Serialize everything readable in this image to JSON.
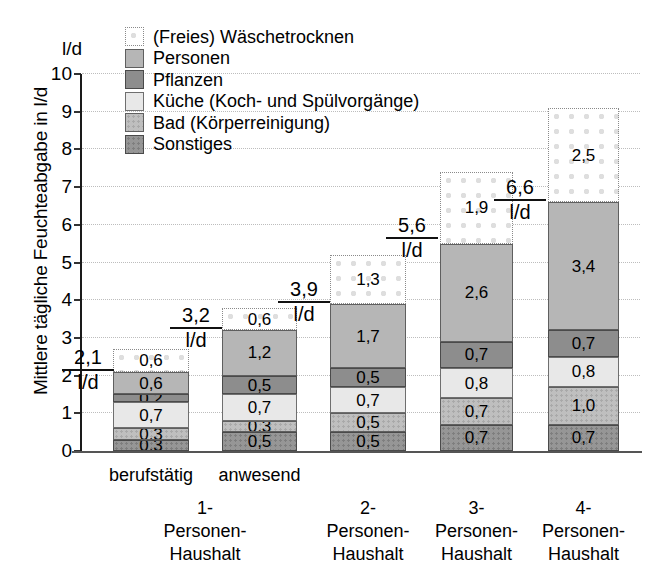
{
  "chart_data": {
    "type": "bar",
    "stacked": true,
    "title": "",
    "xlabel": "",
    "ylabel": "Mittlere tägliche Feuchteabgabe in l/d",
    "yunit": "l/d",
    "ylim": [
      0,
      10
    ],
    "yticks": [
      "0",
      "1",
      "2",
      "3",
      "4",
      "5",
      "6",
      "7",
      "8",
      "9",
      "10"
    ],
    "grid": true,
    "legend_position": "top-center",
    "categories": [
      {
        "sub": "berufstätig",
        "main": [
          "1-",
          "Personen-",
          "Haushalt"
        ]
      },
      {
        "sub": "anwesend",
        "main": [
          "",
          "",
          ""
        ]
      },
      {
        "sub": "",
        "main": [
          "2-",
          "Personen-",
          "Haushalt"
        ]
      },
      {
        "sub": "",
        "main": [
          "3-",
          "Personen-",
          "Haushalt"
        ]
      },
      {
        "sub": "",
        "main": [
          "4-",
          "Personen-",
          "Haushalt"
        ]
      }
    ],
    "series": [
      {
        "name": "Sonstiges",
        "key": "sonstiges",
        "values": [
          0.3,
          0.5,
          0.5,
          0.7,
          0.7
        ],
        "labels": [
          "0,3",
          "0,5",
          "0,5",
          "0,7",
          "0,7"
        ]
      },
      {
        "name": "Bad (Körperreinigung)",
        "key": "bad",
        "values": [
          0.3,
          0.3,
          0.5,
          0.7,
          1.0
        ],
        "labels": [
          "0,3",
          "0,3",
          "0,5",
          "0,7",
          "1,0"
        ]
      },
      {
        "name": "Küche (Koch- und Spülvorgänge)",
        "key": "kueche",
        "values": [
          0.7,
          0.7,
          0.7,
          0.8,
          0.8
        ],
        "labels": [
          "0,7",
          "0,7",
          "0,7",
          "0,8",
          "0,8"
        ]
      },
      {
        "name": "Pflanzen",
        "key": "pflanzen",
        "values": [
          0.2,
          0.5,
          0.5,
          0.7,
          0.7
        ],
        "labels": [
          "0,2",
          "0,5",
          "0,5",
          "0,7",
          "0,7"
        ]
      },
      {
        "name": "Personen",
        "key": "personen",
        "values": [
          0.6,
          1.2,
          1.7,
          2.6,
          3.4
        ],
        "labels": [
          "0,6",
          "1,2",
          "1,7",
          "2,6",
          "3,4"
        ]
      },
      {
        "name": "(Freies) Wäschetrocknen",
        "key": "waesche",
        "values": [
          0.6,
          0.6,
          1.3,
          1.9,
          2.5
        ],
        "labels": [
          "0,6",
          "0,6",
          "1,3",
          "1,9",
          "2,5"
        ]
      }
    ],
    "totals": {
      "values": [
        2.1,
        3.2,
        3.9,
        5.6,
        6.6
      ],
      "labels": [
        "2,1",
        "3,2",
        "3,9",
        "5,6",
        "6,6"
      ],
      "unit": "l/d"
    }
  },
  "legend": {
    "items": [
      {
        "label": "(Freies) Wäschetrocknen",
        "key": "waesche"
      },
      {
        "label": "Personen",
        "key": "personen"
      },
      {
        "label": "Pflanzen",
        "key": "pflanzen"
      },
      {
        "label": "Küche (Koch- und Spülvorgänge)",
        "key": "kueche"
      },
      {
        "label": "Bad (Körperreinigung)",
        "key": "bad"
      },
      {
        "label": "Sonstiges",
        "key": "sonstiges"
      }
    ]
  },
  "colors": {
    "waesche": "#ffffff",
    "personen": "#b6b6b6",
    "pflanzen": "#8d8d8d",
    "kueche": "#e8e8e8",
    "bad": "#bfbfbf",
    "sonstiges": "#969696",
    "axis": "#1a1a1a",
    "grid": "#bdbdbd",
    "background": "#ffffff"
  }
}
